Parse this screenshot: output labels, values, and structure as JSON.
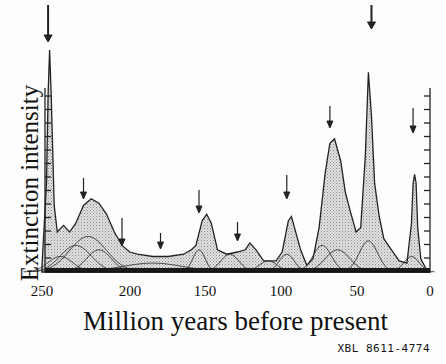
{
  "chart_data": {
    "type": "area",
    "title": "",
    "xlabel": "Million years before present",
    "ylabel": "Extinction intensity",
    "x_ticks": [
      "250",
      "200",
      "150",
      "100",
      "50",
      "0"
    ],
    "xlim": [
      250,
      0
    ],
    "y_ticks_unlabeled": true,
    "grid": false,
    "legend": null,
    "figure_code": "XBL 8611-4774",
    "series": [
      {
        "name": "Total extinction intensity (stippled envelope)",
        "x": [
          252,
          249,
          248,
          247,
          246,
          244,
          242,
          238,
          234,
          230,
          225,
          220,
          215,
          210,
          205,
          200,
          195,
          190,
          180,
          170,
          160,
          155,
          152,
          148,
          145,
          142,
          138,
          132,
          125,
          120,
          117,
          113,
          108,
          100,
          96,
          92,
          90,
          88,
          84,
          80,
          76,
          72,
          68,
          65,
          62,
          58,
          55,
          52,
          48,
          45,
          42,
          40,
          38,
          36,
          33,
          30,
          25,
          20,
          15,
          12,
          11,
          10,
          9,
          8,
          6,
          3,
          0
        ],
        "values": [
          2,
          40,
          80,
          100,
          80,
          30,
          18,
          21,
          18,
          22,
          30,
          33,
          31,
          26,
          18,
          12,
          9,
          8,
          7,
          7,
          8,
          10,
          12,
          23,
          26,
          22,
          10,
          8,
          9,
          10,
          13,
          10,
          5,
          5,
          9,
          23,
          25,
          20,
          10,
          3,
          6,
          20,
          45,
          58,
          60,
          50,
          36,
          28,
          18,
          20,
          52,
          90,
          70,
          40,
          25,
          15,
          10,
          5,
          4,
          22,
          40,
          44,
          40,
          20,
          6,
          2,
          0
        ]
      }
    ],
    "marked_extinction_events_ma": [
      248,
      225,
      200,
      175,
      150,
      125,
      93,
      65,
      38,
      11
    ],
    "ylim": [
      0,
      100
    ]
  }
}
